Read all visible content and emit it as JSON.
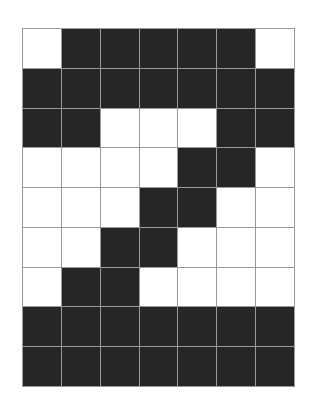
{
  "diagram": {
    "type": "pixel-grid",
    "columns": 7,
    "rows": 9,
    "colors": {
      "filled": "#262626",
      "empty": "#ffffff",
      "gridline": "#9a9a9a"
    },
    "cells": [
      [
        0,
        1,
        1,
        1,
        1,
        1,
        0
      ],
      [
        1,
        1,
        1,
        1,
        1,
        1,
        1
      ],
      [
        1,
        1,
        0,
        0,
        0,
        1,
        1
      ],
      [
        0,
        0,
        0,
        0,
        1,
        1,
        0
      ],
      [
        0,
        0,
        0,
        1,
        1,
        0,
        0
      ],
      [
        0,
        0,
        1,
        1,
        0,
        0,
        0
      ],
      [
        0,
        1,
        1,
        0,
        0,
        0,
        0
      ],
      [
        1,
        1,
        1,
        1,
        1,
        1,
        1
      ],
      [
        1,
        1,
        1,
        1,
        1,
        1,
        1
      ]
    ]
  }
}
